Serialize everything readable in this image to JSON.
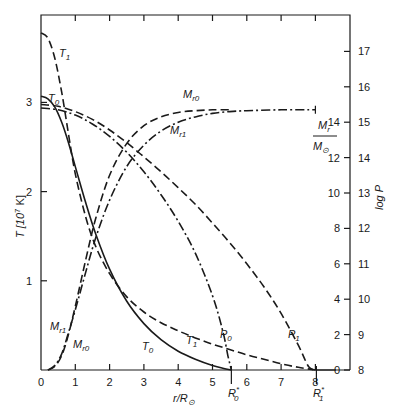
{
  "chart_data": {
    "type": "line",
    "title": "",
    "xlabel": "r/R⊙",
    "ylabel_left": "T [10⁷ K]",
    "ylabel_right": "log P",
    "ylabel_right_inner": "M_r/M⊙",
    "xlim": [
      0,
      8.9
    ],
    "ylim_left": [
      0,
      3.98
    ],
    "ylim_right_logP": [
      8,
      17.95
    ],
    "ylim_right_mass": [
      0,
      19.9
    ],
    "x_ticks": [
      0,
      1,
      2,
      3,
      4,
      5,
      6,
      7,
      8
    ],
    "y_ticks_left": [
      1,
      2,
      3
    ],
    "y_ticks_right_logP": [
      8,
      9,
      10,
      11,
      12,
      13,
      14,
      15,
      16,
      17
    ],
    "y_ticks_right_mass": [
      0,
      2,
      4,
      6,
      8,
      10,
      12,
      14
    ],
    "grid": false,
    "legend": "inline curve labels",
    "annotations": [
      {
        "text": "R₀*",
        "x": 5.55
      },
      {
        "text": "R₁*",
        "x": 8.0
      }
    ],
    "series": [
      {
        "name": "T0",
        "label": "T",
        "sub": "0",
        "axis": "T",
        "style": "solid",
        "x": [
          0,
          0.2,
          0.4,
          0.6,
          0.8,
          1.0,
          1.3,
          1.6,
          2.0,
          2.5,
          3.0,
          3.5,
          4.0,
          4.5,
          5.0,
          5.3,
          5.55
        ],
        "y": [
          3.07,
          3.04,
          2.95,
          2.78,
          2.55,
          2.28,
          1.88,
          1.52,
          1.13,
          0.77,
          0.52,
          0.34,
          0.21,
          0.12,
          0.05,
          0.02,
          0.0
        ]
      },
      {
        "name": "T1",
        "label": "T",
        "sub": "1",
        "axis": "T",
        "style": "dash",
        "x": [
          0,
          0.2,
          0.4,
          0.6,
          0.8,
          1.0,
          1.3,
          1.6,
          2.0,
          2.5,
          3.0,
          3.5,
          4.0,
          4.5,
          5.0,
          5.5,
          6.0,
          6.5,
          7.0,
          7.5,
          8.0
        ],
        "y": [
          3.78,
          3.72,
          3.5,
          3.12,
          2.65,
          2.2,
          1.72,
          1.38,
          1.08,
          0.82,
          0.65,
          0.53,
          0.44,
          0.36,
          0.29,
          0.23,
          0.17,
          0.12,
          0.07,
          0.03,
          0.0
        ]
      },
      {
        "name": "P0",
        "label": "P",
        "sub": "0",
        "axis": "logP",
        "style": "dashdot",
        "x": [
          0,
          0.5,
          1.0,
          1.5,
          2.0,
          2.5,
          3.0,
          3.5,
          4.0,
          4.5,
          5.0,
          5.3,
          5.45,
          5.55
        ],
        "y": [
          15.4,
          15.35,
          15.2,
          14.95,
          14.6,
          14.15,
          13.6,
          12.95,
          12.2,
          11.3,
          10.1,
          9.1,
          8.4,
          8.0
        ]
      },
      {
        "name": "P1",
        "label": "P",
        "sub": "1",
        "axis": "logP",
        "style": "dash",
        "x": [
          0,
          0.5,
          1.0,
          1.5,
          2.0,
          2.5,
          3.0,
          3.5,
          4.0,
          4.5,
          5.0,
          5.5,
          6.0,
          6.5,
          7.0,
          7.5,
          7.8,
          8.0
        ],
        "y": [
          15.5,
          15.45,
          15.3,
          15.08,
          14.78,
          14.42,
          14.02,
          13.6,
          13.15,
          12.68,
          12.15,
          11.6,
          11.0,
          10.35,
          9.6,
          8.7,
          8.1,
          8.0
        ]
      },
      {
        "name": "Mr0",
        "label": "M",
        "sub": "r0",
        "axis": "mass",
        "style": "dash",
        "x": [
          0.2,
          0.4,
          0.6,
          0.8,
          1.0,
          1.3,
          1.6,
          2.0,
          2.5,
          3.0,
          3.5,
          4.0,
          4.5,
          5.0,
          5.5
        ],
        "y": [
          0,
          0.2,
          0.8,
          2.0,
          3.6,
          6.2,
          8.6,
          11.0,
          12.8,
          13.8,
          14.3,
          14.55,
          14.65,
          14.7,
          14.7
        ]
      },
      {
        "name": "Mr1",
        "label": "M",
        "sub": "r1",
        "axis": "mass",
        "style": "dashdot",
        "x": [
          0.2,
          0.4,
          0.6,
          0.8,
          1.0,
          1.3,
          1.6,
          2.0,
          2.5,
          3.0,
          3.5,
          4.0,
          4.5,
          5.0,
          5.5,
          6.0,
          7.0,
          8.0
        ],
        "y": [
          0,
          0.25,
          0.9,
          2.1,
          3.4,
          5.5,
          7.5,
          9.6,
          11.5,
          12.7,
          13.5,
          14.0,
          14.3,
          14.5,
          14.6,
          14.65,
          14.7,
          14.7
        ]
      }
    ]
  },
  "labels": {
    "x_axis": "r/R",
    "x_axis_sub": "⊙",
    "y_left": "T [10",
    "y_left_sup": "7",
    "y_left_end": " K]",
    "y_right": "log P",
    "mass_num": "M",
    "mass_num_sub": "r",
    "mass_den": "M",
    "mass_den_sub": "⊙",
    "r0": "R",
    "r0_sub": "0",
    "r1": "R",
    "r1_sub": "1",
    "star": "*",
    "origin": "0"
  }
}
